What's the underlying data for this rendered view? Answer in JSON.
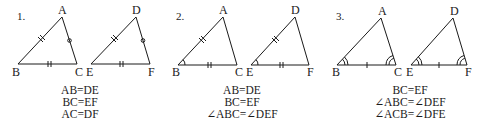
{
  "problems": [
    {
      "number": "1.",
      "tri1": {
        "A": "A",
        "B": "B",
        "C": "C"
      },
      "tri2": {
        "D": "D",
        "E": "E",
        "F": "F"
      },
      "conditions": [
        "AB=DE",
        "BC=EF",
        "AC=DF"
      ]
    },
    {
      "number": "2.",
      "tri1": {
        "A": "A",
        "B": "B",
        "C": "C"
      },
      "tri2": {
        "D": "D",
        "E": "E",
        "F": "F"
      },
      "conditions": [
        "AB=DE",
        "BC=EF",
        "∠ABC=∠DEF"
      ]
    },
    {
      "number": "3.",
      "tri1": {
        "A": "A",
        "B": "B",
        "C": "C"
      },
      "tri2": {
        "D": "D",
        "E": "E",
        "F": "F"
      },
      "conditions": [
        "BC=EF",
        "∠ABC=∠DEF",
        "∠ACB=∠DFE"
      ]
    }
  ],
  "colors": {
    "stroke": "#1a1a1a",
    "background": "#ffffff"
  }
}
